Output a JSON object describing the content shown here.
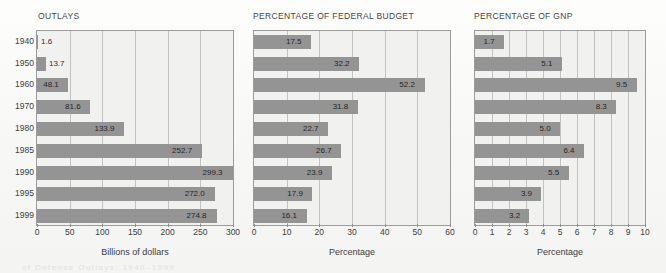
{
  "figure": {
    "bleed_text": "of Defense Outlays: 1940–1999",
    "bar_color": "#949494",
    "plot_background": "#f1f1ef",
    "axis_color": "#9b9b9b",
    "grid_color": "#c2c2c0"
  },
  "chart_data": [
    {
      "type": "bar",
      "orientation": "horizontal",
      "title": "OUTLAYS",
      "xlabel": "Billions of dollars",
      "ylabel": "",
      "categories": [
        "1940",
        "1950",
        "1960",
        "1970",
        "1980",
        "1985",
        "1990",
        "1995",
        "1999"
      ],
      "values": [
        1.6,
        13.7,
        48.1,
        81.6,
        133.9,
        252.7,
        299.3,
        272.0,
        274.8
      ],
      "value_labels": [
        "1.6",
        "13.7",
        "48.1",
        "81.6",
        "133.9",
        "252.7",
        "299.3",
        "272.0",
        "274.8"
      ],
      "xlim": [
        0,
        300
      ],
      "xticks": [
        0,
        50,
        100,
        150,
        200,
        250,
        300
      ],
      "xtick_labels": [
        "0",
        "50",
        "100",
        "150",
        "200",
        "250",
        "300"
      ],
      "grid": true,
      "legend": false
    },
    {
      "type": "bar",
      "orientation": "horizontal",
      "title": "PERCENTAGE OF FEDERAL BUDGET",
      "xlabel": "Percentage",
      "ylabel": "",
      "categories": [
        "1940",
        "1950",
        "1960",
        "1970",
        "1980",
        "1985",
        "1990",
        "1995",
        "1999"
      ],
      "values": [
        17.5,
        32.2,
        52.2,
        31.8,
        22.7,
        26.7,
        23.9,
        17.9,
        16.1
      ],
      "value_labels": [
        "17.5",
        "32.2",
        "52.2",
        "31.8",
        "22.7",
        "26.7",
        "23.9",
        "17.9",
        "16.1"
      ],
      "xlim": [
        0,
        60
      ],
      "xticks": [
        0,
        10,
        20,
        30,
        40,
        50,
        60
      ],
      "xtick_labels": [
        "0",
        "10",
        "20",
        "30",
        "40",
        "50",
        "60"
      ],
      "grid": true,
      "legend": false
    },
    {
      "type": "bar",
      "orientation": "horizontal",
      "title": "PERCENTAGE OF GNP",
      "xlabel": "Percentage",
      "ylabel": "",
      "categories": [
        "1940",
        "1950",
        "1960",
        "1970",
        "1980",
        "1985",
        "1990",
        "1995",
        "1999"
      ],
      "values": [
        1.7,
        5.1,
        9.5,
        8.3,
        5.0,
        6.4,
        5.5,
        3.9,
        3.2
      ],
      "value_labels": [
        "1.7",
        "5.1",
        "9.5",
        "8.3",
        "5.0",
        "6.4",
        "5.5",
        "3.9",
        "3.2"
      ],
      "xlim": [
        0,
        10
      ],
      "xticks": [
        0,
        1,
        2,
        3,
        4,
        5,
        6,
        7,
        8,
        9,
        10
      ],
      "xtick_labels": [
        "0",
        "1",
        "2",
        "3",
        "4",
        "5",
        "6",
        "7",
        "8",
        "9",
        "10"
      ],
      "grid": true,
      "legend": false
    }
  ]
}
